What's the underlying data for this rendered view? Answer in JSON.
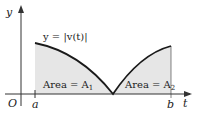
{
  "diagram": {
    "curve_label": "y = |v(t)|",
    "axes": {
      "y_label": "y",
      "x_label": "t",
      "origin_label": "O"
    },
    "ticks": {
      "a": "a",
      "b": "b"
    },
    "regions": [
      {
        "label": "Area = A",
        "subscript": "1"
      },
      {
        "label": "Area = A",
        "subscript": "2"
      }
    ],
    "colors": {
      "fill": "#e6e6e6",
      "curve": "#1a1a1a",
      "axis": "#333333"
    }
  }
}
